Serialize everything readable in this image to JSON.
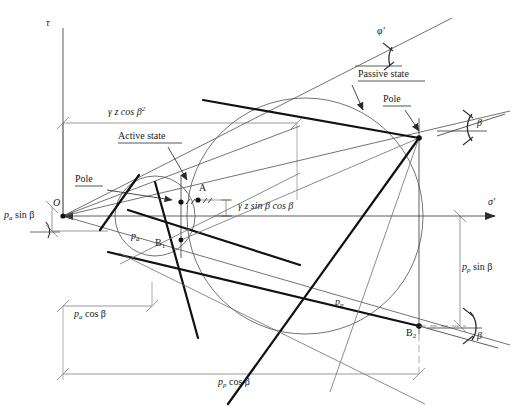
{
  "figure": {
    "type": "mohr-circle-earth-pressure-diagram",
    "axes": {
      "y_label": "τ",
      "x_label": "σ'",
      "origin_label": "O"
    },
    "annotations": {
      "active_state": "Active state",
      "passive_state": "Passive state",
      "pole_active": "Pole",
      "pole_passive": "Pole",
      "point_a": "A",
      "point_b1": "B",
      "point_b1_sub": "1",
      "point_b2": "B",
      "point_b2_sub": "2",
      "friction_angle": "φ'",
      "beta_top_right": "β",
      "beta_bottom_right": "β",
      "beta_left": "β",
      "pa_line_label": "p",
      "pa_line_label_sub": "a",
      "pp_line_label": "p",
      "pp_line_label_sub": "p"
    },
    "dimensions": {
      "top": {
        "prefix": "γ z cos β",
        "superscript": "2",
        "full": "γ z cos β²"
      },
      "middle": {
        "full": "γ z sin β cos β"
      },
      "left_vertical": {
        "prefix": "p",
        "sub": "a",
        "suffix": " sin  β",
        "full": "pₐ sin β"
      },
      "lower_left": {
        "prefix": "p",
        "sub": "a",
        "suffix": " cos β",
        "full": "pₐ cos β"
      },
      "right_vertical": {
        "prefix": "p",
        "sub": "p",
        "suffix": " sin  β",
        "full": "p_p sin β"
      },
      "bottom": {
        "prefix": "p",
        "sub": "p",
        "suffix": " cos β",
        "full": "p_p cos β"
      }
    },
    "colors": {
      "line": "#3a3a3a",
      "thin": "#5c5c5c",
      "bold": "#111111",
      "dim": "#6b6b6b",
      "text": "#1a1a1a"
    },
    "geometry": {
      "origin": {
        "x": 63,
        "y": 216
      },
      "sigma_axis_end": {
        "x": 505,
        "y": 216
      },
      "tau_axis_top": {
        "x": 63,
        "y": 22
      },
      "active_circle": {
        "cx": 155,
        "cy": 216,
        "r": 40
      },
      "passive_circle": {
        "cx": 305,
        "cy": 216,
        "r": 118
      },
      "point_a": {
        "x": 198,
        "y": 200
      },
      "pole_active": {
        "x": 179,
        "y": 202
      },
      "pole_passive": {
        "x": 419,
        "y": 138
      },
      "point_b1": {
        "x": 181,
        "y": 240
      },
      "point_b2": {
        "x": 419,
        "y": 326
      }
    }
  }
}
